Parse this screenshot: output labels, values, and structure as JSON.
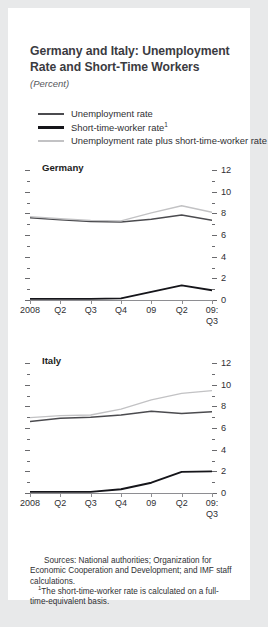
{
  "figure": {
    "title": "Germany and Italy: Unemployment Rate and Short-Time Workers",
    "units": "(Percent)"
  },
  "legend": {
    "items": [
      {
        "label": "Unemployment rate",
        "marker": "",
        "color": "#4b4b4f"
      },
      {
        "label": "Short-time-worker rate",
        "marker": "1",
        "color": "#15151a"
      },
      {
        "label": "Unemployment rate plus short-time-worker rate",
        "marker": "",
        "color": "#c2c2c4"
      }
    ]
  },
  "notes": {
    "sources": "Sources: National authorities; Organization for Economic Cooperation and Development; and IMF staff calculations.",
    "footnote_marker": "1",
    "footnote": "The short-time-worker rate is calculated on a full-time-equivalent basis."
  },
  "chart_data": [
    {
      "type": "line",
      "title": "Germany",
      "xlabel": "",
      "ylabel": "",
      "ylim": [
        0,
        12
      ],
      "yticks": [
        0,
        2,
        4,
        6,
        8,
        10,
        12
      ],
      "yminor": [
        1,
        3,
        5,
        7,
        9,
        11
      ],
      "grid": false,
      "legend_position": "top",
      "categories": [
        "2008",
        "Q2",
        "Q3",
        "Q4",
        "09",
        "Q2",
        "09:\nQ3"
      ],
      "series": [
        {
          "name": "Unemployment rate",
          "color": "#4b4b4f",
          "values": [
            7.6,
            7.4,
            7.25,
            7.2,
            7.45,
            7.85,
            7.35
          ]
        },
        {
          "name": "Short-time-worker rate",
          "color": "#15151a",
          "values": [
            0.1,
            0.1,
            0.1,
            0.15,
            0.75,
            1.35,
            0.9
          ]
        },
        {
          "name": "Unemployment rate plus short-time-worker rate",
          "color": "#c2c2c4",
          "values": [
            7.7,
            7.5,
            7.35,
            7.3,
            8.05,
            8.7,
            8.1
          ]
        }
      ]
    },
    {
      "type": "line",
      "title": "Italy",
      "xlabel": "",
      "ylabel": "",
      "ylim": [
        0,
        12
      ],
      "yticks": [
        0,
        2,
        4,
        6,
        8,
        10,
        12
      ],
      "yminor": [
        1,
        3,
        5,
        7,
        9,
        11
      ],
      "grid": false,
      "legend_position": "top",
      "categories": [
        "2008",
        "Q2",
        "Q3",
        "Q4",
        "09",
        "Q2",
        "09:\nQ3"
      ],
      "series": [
        {
          "name": "Unemployment rate",
          "color": "#4b4b4f",
          "values": [
            6.6,
            6.9,
            7.0,
            7.2,
            7.55,
            7.35,
            7.5
          ]
        },
        {
          "name": "Short-time-worker rate",
          "color": "#15151a",
          "values": [
            0.1,
            0.1,
            0.1,
            0.35,
            0.95,
            1.95,
            2.0
          ]
        },
        {
          "name": "Unemployment rate plus short-time-worker rate",
          "color": "#c2c2c4",
          "values": [
            6.95,
            7.15,
            7.2,
            7.75,
            8.6,
            9.2,
            9.45
          ]
        }
      ]
    }
  ]
}
